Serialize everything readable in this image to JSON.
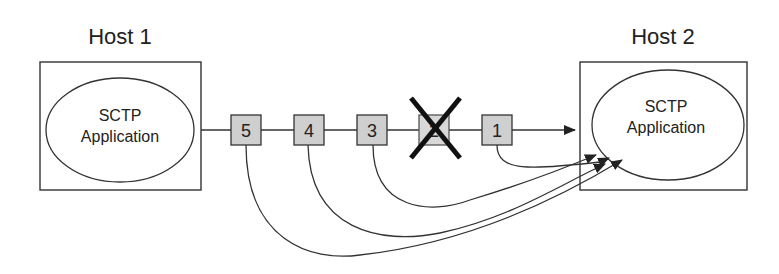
{
  "diagram": {
    "type": "sctp-unordered-delivery",
    "hosts": [
      {
        "id": "host1",
        "label": "Host 1",
        "app_line1": "SCTP",
        "app_line2": "Application"
      },
      {
        "id": "host2",
        "label": "Host 2",
        "app_line1": "SCTP",
        "app_line2": "Application"
      }
    ],
    "packets": [
      {
        "id": "p5",
        "label": "5",
        "lost": false
      },
      {
        "id": "p4",
        "label": "4",
        "lost": false
      },
      {
        "id": "p3",
        "label": "3",
        "lost": false
      },
      {
        "id": "p2",
        "label": "2",
        "lost": true
      },
      {
        "id": "p1",
        "label": "1",
        "lost": false
      }
    ],
    "colors": {
      "stroke": "#333333",
      "packet_fill": "#cfcfcf",
      "lost_mark": "#111111",
      "background": "#ffffff"
    }
  }
}
